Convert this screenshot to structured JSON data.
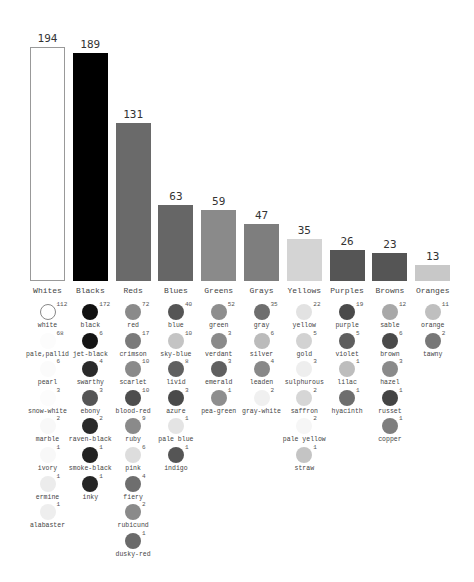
{
  "chart_data": {
    "type": "bar",
    "title": "",
    "xlabel": "",
    "ylabel": "",
    "ylim": [
      0,
      194
    ],
    "grid": false,
    "categories": [
      "Whites",
      "Blacks",
      "Reds",
      "Blues",
      "Greens",
      "Grays",
      "Yellows",
      "Purples",
      "Browns",
      "Oranges"
    ],
    "values": [
      194,
      189,
      131,
      63,
      59,
      47,
      35,
      26,
      23,
      13
    ],
    "bar_colors": [
      "#ffffff",
      "#000000",
      "#6a6a6a",
      "#666666",
      "#8a8a8a",
      "#7e7e7e",
      "#d4d4d4",
      "#555555",
      "#555555",
      "#c8c8c8"
    ],
    "breakdown": [
      {
        "category": "Whites",
        "terms": [
          {
            "name": "white",
            "count": 112,
            "color": "#ffffff",
            "outlined": true
          },
          {
            "name": "pale,pallid",
            "count": 68,
            "color": "#fcfcfc"
          },
          {
            "name": "pearl",
            "count": 6,
            "color": "#fbfbfb"
          },
          {
            "name": "snow-white",
            "count": 3,
            "color": "#fcfcfc"
          },
          {
            "name": "marble",
            "count": 2,
            "color": "#f8f8f8"
          },
          {
            "name": "ivory",
            "count": 1,
            "color": "#f8f8f8"
          },
          {
            "name": "ermine",
            "count": 1,
            "color": "#ececec"
          },
          {
            "name": "alabaster",
            "count": 1,
            "color": "#eeeeee"
          }
        ]
      },
      {
        "category": "Blacks",
        "terms": [
          {
            "name": "black",
            "count": 172,
            "color": "#111111"
          },
          {
            "name": "jet-black",
            "count": 6,
            "color": "#141414"
          },
          {
            "name": "swarthy",
            "count": 4,
            "color": "#2a2a2a"
          },
          {
            "name": "ebony",
            "count": 3,
            "color": "#555555"
          },
          {
            "name": "raven-black",
            "count": 2,
            "color": "#2a2a2a"
          },
          {
            "name": "smoke-black",
            "count": 1,
            "color": "#222222"
          },
          {
            "name": "inky",
            "count": 1,
            "color": "#252525"
          }
        ]
      },
      {
        "category": "Reds",
        "terms": [
          {
            "name": "red",
            "count": 72,
            "color": "#8a8a8a"
          },
          {
            "name": "crimson",
            "count": 17,
            "color": "#7a7a7a"
          },
          {
            "name": "scarlet",
            "count": 10,
            "color": "#8a8a8a"
          },
          {
            "name": "blood-red",
            "count": 10,
            "color": "#4e4e4e"
          },
          {
            "name": "ruby",
            "count": 9,
            "color": "#8a8a8a"
          },
          {
            "name": "pink",
            "count": 6,
            "color": "#dddddd"
          },
          {
            "name": "fiery",
            "count": 4,
            "color": "#6e6e6e"
          },
          {
            "name": "rubicund",
            "count": 2,
            "color": "#8a8a8a"
          },
          {
            "name": "dusky-red",
            "count": 1,
            "color": "#6a6a6a"
          }
        ]
      },
      {
        "category": "Blues",
        "terms": [
          {
            "name": "blue",
            "count": 40,
            "color": "#555555"
          },
          {
            "name": "sky-blue",
            "count": 10,
            "color": "#c4c4c4"
          },
          {
            "name": "livid",
            "count": 8,
            "color": "#606060"
          },
          {
            "name": "azure",
            "count": 3,
            "color": "#4a4a4a"
          },
          {
            "name": "pale blue",
            "count": 1,
            "color": "#e4e4e4"
          },
          {
            "name": "indigo",
            "count": 1,
            "color": "#555555"
          }
        ]
      },
      {
        "category": "Greens",
        "terms": [
          {
            "name": "green",
            "count": 52,
            "color": "#8e8e8e"
          },
          {
            "name": "verdant",
            "count": 3,
            "color": "#8a8a8a"
          },
          {
            "name": "emerald",
            "count": 3,
            "color": "#606060"
          },
          {
            "name": "pea-green",
            "count": 1,
            "color": "#8e8e8e"
          }
        ]
      },
      {
        "category": "Grays",
        "terms": [
          {
            "name": "gray",
            "count": 35,
            "color": "#6e6e6e"
          },
          {
            "name": "silver",
            "count": 6,
            "color": "#bbbbbb"
          },
          {
            "name": "leaden",
            "count": 4,
            "color": "#888888"
          },
          {
            "name": "gray-white",
            "count": 2,
            "color": "#f0f0f0"
          }
        ]
      },
      {
        "category": "Yellows",
        "terms": [
          {
            "name": "yellow",
            "count": 22,
            "color": "#e2e2e2"
          },
          {
            "name": "gold",
            "count": 5,
            "color": "#d2d2d2"
          },
          {
            "name": "sulphurous",
            "count": 3,
            "color": "#eeeeee"
          },
          {
            "name": "saffron",
            "count": 2,
            "color": "#d6d6d6"
          },
          {
            "name": "pale yellow",
            "count": 2,
            "color": "#f6f6f6"
          },
          {
            "name": "straw",
            "count": 1,
            "color": "#c4c4c4"
          }
        ]
      },
      {
        "category": "Purples",
        "terms": [
          {
            "name": "purple",
            "count": 19,
            "color": "#4a4a4a"
          },
          {
            "name": "violet",
            "count": 5,
            "color": "#5e5e5e"
          },
          {
            "name": "lilac",
            "count": 1,
            "color": "#bdbdbd"
          },
          {
            "name": "hyacinth",
            "count": 1,
            "color": "#6e6e6e"
          }
        ]
      },
      {
        "category": "Browns",
        "terms": [
          {
            "name": "sable",
            "count": 12,
            "color": "#a8a8a8"
          },
          {
            "name": "brown",
            "count": 6,
            "color": "#4a4a4a"
          },
          {
            "name": "hazel",
            "count": 3,
            "color": "#8a8a8a"
          },
          {
            "name": "russet",
            "count": 1,
            "color": "#444444"
          },
          {
            "name": "copper",
            "count": 1,
            "color": "#7e7e7e"
          }
        ]
      },
      {
        "category": "Oranges",
        "terms": [
          {
            "name": "orange",
            "count": 11,
            "color": "#bfbfbf"
          },
          {
            "name": "tawny",
            "count": 2,
            "color": "#777777"
          }
        ]
      }
    ]
  }
}
